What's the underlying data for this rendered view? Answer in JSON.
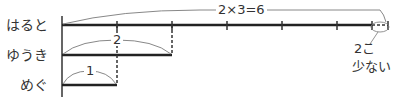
{
  "rows": [
    {
      "name": "はると",
      "label": "はると"
    },
    {
      "name": "ゆうき",
      "label": "ゆうき"
    },
    {
      "name": "めぐ",
      "label": "めぐ"
    }
  ],
  "annotations": {
    "haruto_total": "2×3=6",
    "yuuki_value": "2",
    "megu_value": "1",
    "difference_line1": "2こ",
    "difference_line2": "少ない"
  },
  "colors": {
    "line": "#333333",
    "brace": "#888888"
  }
}
